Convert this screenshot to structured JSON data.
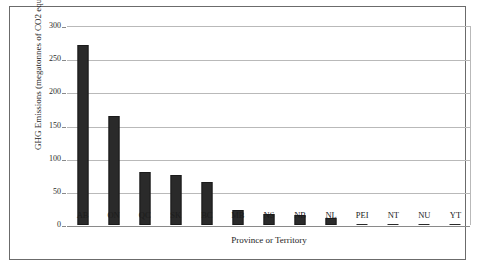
{
  "chart_data": {
    "type": "bar",
    "title": "",
    "xlabel": "Province or Territory",
    "ylabel": "GHG Emissions (megatonnes of CO2 equivalent)",
    "categories": [
      "AB",
      "ON",
      "QC",
      "SK",
      "BC",
      "MB",
      "NS",
      "NB",
      "NL",
      "PEI",
      "NT",
      "NU",
      "YT"
    ],
    "values": [
      272,
      165,
      80,
      76,
      65,
      22,
      17,
      15,
      11,
      2,
      1.5,
      0.6,
      0.6
    ],
    "ylim": [
      0,
      300
    ],
    "yticks": [
      0,
      50,
      100,
      150,
      200,
      250,
      300
    ],
    "ytick_labels": [
      "0",
      "50",
      "100",
      "150",
      "200",
      "250",
      "300"
    ],
    "grid": true,
    "legend": false,
    "bar_color": "#2a2a2a",
    "grid_color": "#b9b9b9",
    "axis_color": "#8a8a8a",
    "frame_color": "#6b6b6b"
  }
}
